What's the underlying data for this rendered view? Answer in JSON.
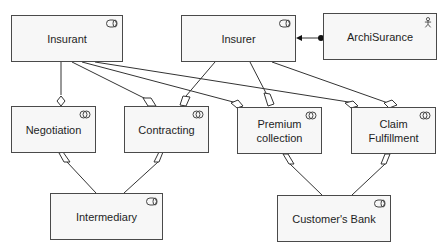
{
  "diagram": {
    "type": "ArchiMate business layer view",
    "nodes": [
      {
        "id": "insurant",
        "label": "Insurant",
        "kind": "business-role",
        "icon": "role-icon"
      },
      {
        "id": "insurer",
        "label": "Insurer",
        "kind": "business-role",
        "icon": "role-icon"
      },
      {
        "id": "archisurance",
        "label": "ArchiSurance",
        "kind": "business-actor",
        "icon": "actor-icon"
      },
      {
        "id": "negotiation",
        "label": "Negotiation",
        "kind": "business-collaboration",
        "icon": "collaboration-icon"
      },
      {
        "id": "contracting",
        "label": "Contracting",
        "kind": "business-collaboration",
        "icon": "collaboration-icon"
      },
      {
        "id": "premium_collection",
        "label": "Premium\ncollection",
        "kind": "business-collaboration",
        "icon": "collaboration-icon"
      },
      {
        "id": "claim_fulfillment",
        "label": "Claim\nFulfillment",
        "kind": "business-collaboration",
        "icon": "collaboration-icon"
      },
      {
        "id": "intermediary",
        "label": "Intermediary",
        "kind": "business-role",
        "icon": "role-icon"
      },
      {
        "id": "customers_bank",
        "label": "Customer's Bank",
        "kind": "business-role",
        "icon": "role-icon"
      }
    ],
    "edges": [
      {
        "from": "archisurance",
        "to": "insurer",
        "type": "assignment"
      },
      {
        "from": "negotiation",
        "to": "insurant",
        "type": "aggregation"
      },
      {
        "from": "contracting",
        "to": "insurant",
        "type": "aggregation"
      },
      {
        "from": "premium_collection",
        "to": "insurant",
        "type": "aggregation"
      },
      {
        "from": "claim_fulfillment",
        "to": "insurant",
        "type": "aggregation"
      },
      {
        "from": "contracting",
        "to": "insurer",
        "type": "aggregation"
      },
      {
        "from": "premium_collection",
        "to": "insurer",
        "type": "aggregation"
      },
      {
        "from": "claim_fulfillment",
        "to": "insurer",
        "type": "aggregation"
      },
      {
        "from": "negotiation",
        "to": "intermediary",
        "type": "aggregation"
      },
      {
        "from": "contracting",
        "to": "intermediary",
        "type": "aggregation"
      },
      {
        "from": "premium_collection",
        "to": "customers_bank",
        "type": "aggregation"
      },
      {
        "from": "claim_fulfillment",
        "to": "customers_bank",
        "type": "aggregation"
      }
    ]
  }
}
